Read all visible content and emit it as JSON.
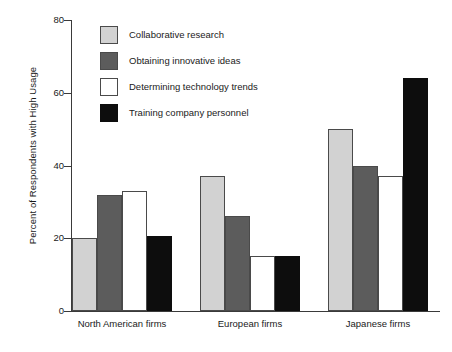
{
  "chart_data": {
    "type": "bar",
    "title": "",
    "xlabel": "",
    "ylabel": "Percent of Respondents with High Usage",
    "ylim": [
      0,
      80
    ],
    "yticks": [
      0,
      20,
      40,
      60,
      80
    ],
    "ytick_labels": [
      "0",
      "20",
      "40",
      "60",
      "80"
    ],
    "grid": false,
    "legend_position": "upper-left-inside",
    "categories": [
      "North American firms",
      "European firms",
      "Japanese firms"
    ],
    "series": [
      {
        "name": "Collaborative research",
        "color": "#d2d2d2",
        "values": [
          20,
          37,
          50
        ]
      },
      {
        "name": "Obtaining innovative ideas",
        "color": "#5c5c5c",
        "values": [
          32,
          26,
          40
        ]
      },
      {
        "name": "Determining technology trends",
        "color": "#ffffff",
        "values": [
          33,
          15,
          37
        ]
      },
      {
        "name": "Training company personnel",
        "color": "#0d0d0d",
        "values": [
          20.5,
          15,
          64
        ]
      }
    ]
  },
  "axis": {
    "y_title": "Percent of Respondents with High Usage"
  }
}
